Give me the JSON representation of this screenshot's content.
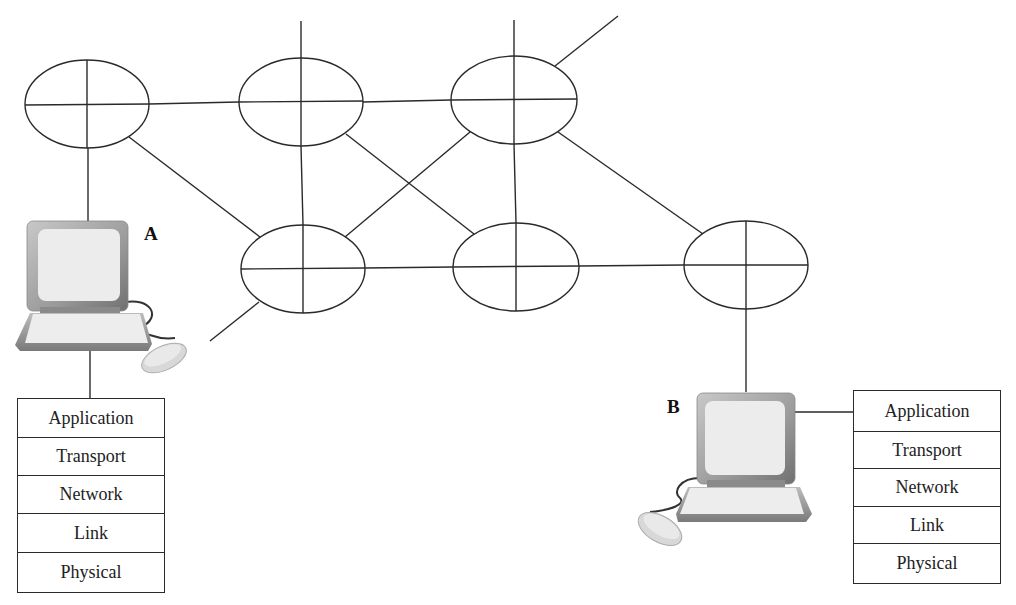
{
  "diagram": {
    "type": "network-topology",
    "colors": {
      "line": "#2a2a2a",
      "monitor_frame": "#9a9a9a",
      "screen": "#ececec"
    },
    "routers": [
      {
        "id": "r1",
        "cx": 87,
        "cy": 104
      },
      {
        "id": "r2",
        "cx": 301,
        "cy": 102
      },
      {
        "id": "r3",
        "cx": 514,
        "cy": 100
      },
      {
        "id": "r4",
        "cx": 303,
        "cy": 269
      },
      {
        "id": "r5",
        "cx": 516,
        "cy": 267
      },
      {
        "id": "r6",
        "cx": 746,
        "cy": 265
      }
    ],
    "links": [
      [
        "r1",
        "r2"
      ],
      [
        "r2",
        "r3"
      ],
      [
        "r1",
        "r4"
      ],
      [
        "r2",
        "r4"
      ],
      [
        "r2",
        "r5"
      ],
      [
        "r3",
        "r4"
      ],
      [
        "r3",
        "r5"
      ],
      [
        "r3",
        "r6"
      ],
      [
        "r4",
        "r5"
      ],
      [
        "r5",
        "r6"
      ],
      [
        "r1",
        "hostA"
      ],
      [
        "r6",
        "hostB"
      ]
    ]
  },
  "hosts": {
    "a": {
      "label": "A",
      "stack": [
        "Application",
        "Transport",
        "Network",
        "Link",
        "Physical"
      ]
    },
    "b": {
      "label": "B",
      "stack": [
        "Application",
        "Transport",
        "Network",
        "Link",
        "Physical"
      ]
    }
  }
}
